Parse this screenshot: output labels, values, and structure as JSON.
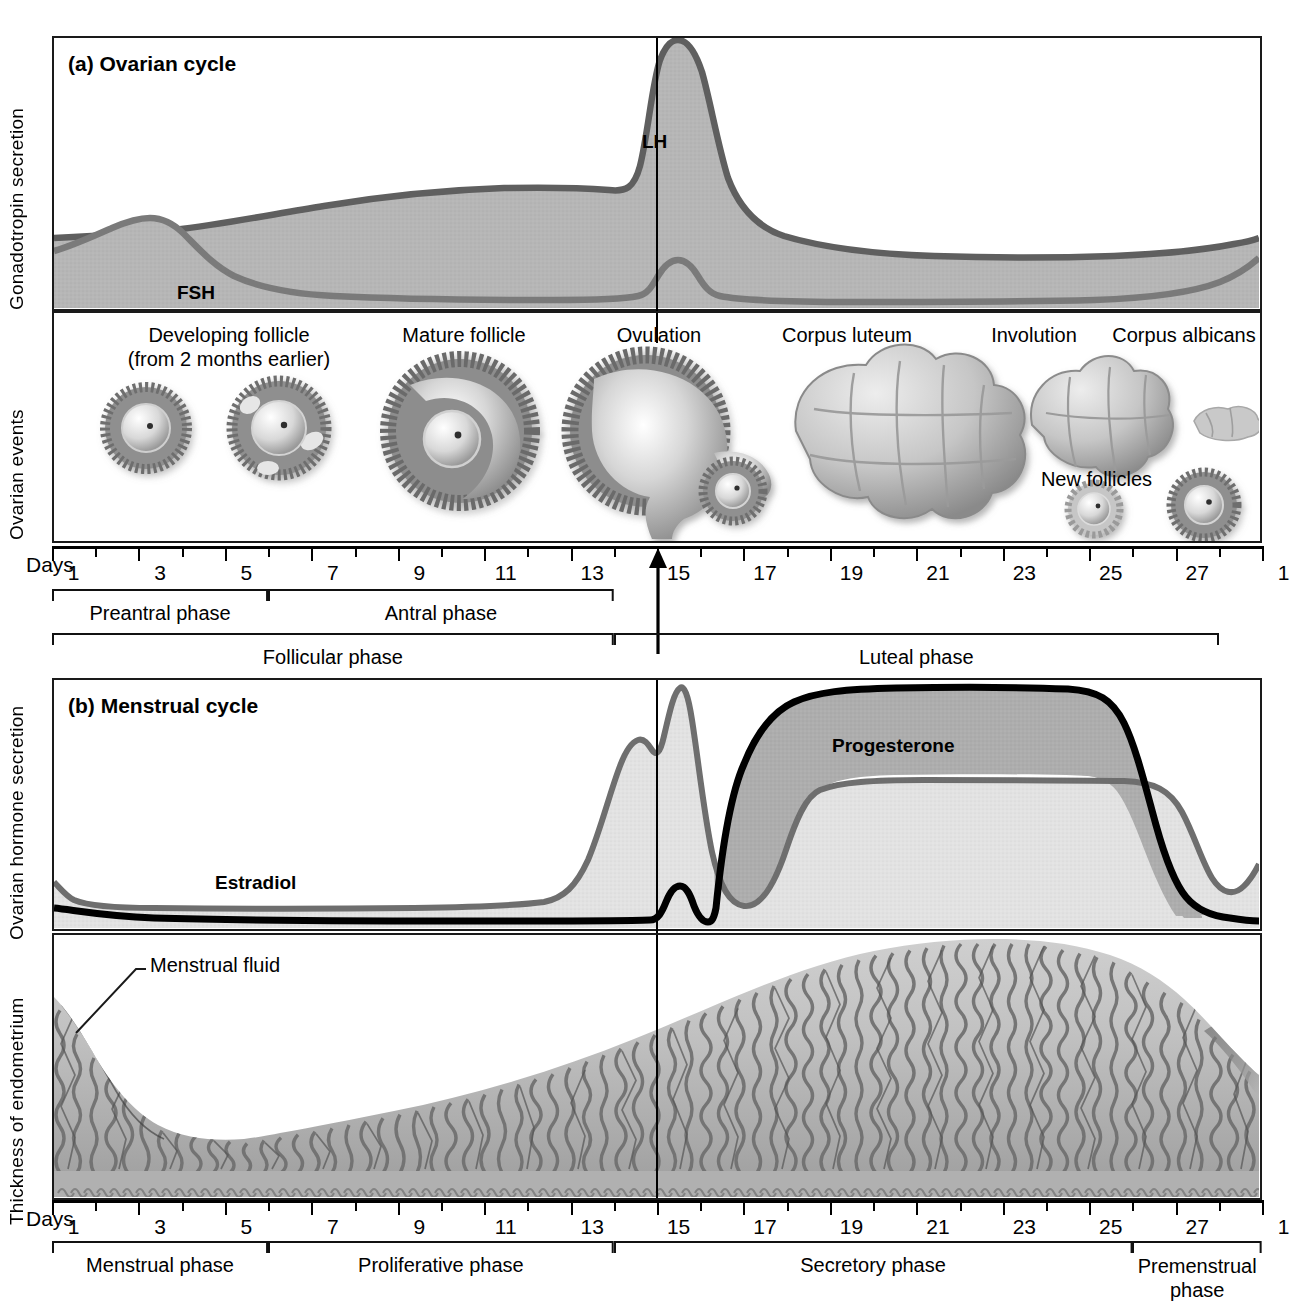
{
  "figure": {
    "panel_a": {
      "title": "(a) Ovarian cycle",
      "y_axis_top": "Gonadotropin secretion",
      "y_axis_bottom": "Ovarian events",
      "curve_labels": {
        "lh": "LH",
        "fsh": "FSH"
      },
      "event_labels": [
        "Developing follicle",
        "(from 2 months earlier)",
        "Mature follicle",
        "Ovulation",
        "Corpus luteum",
        "Involution",
        "Corpus albicans",
        "New follicles"
      ],
      "days_word": "Days",
      "day_ticks": [
        "1",
        "3",
        "5",
        "7",
        "9",
        "11",
        "13",
        "15",
        "17",
        "19",
        "21",
        "23",
        "25",
        "27",
        "1"
      ],
      "brackets": [
        {
          "label": "Preantral phase",
          "start_day": 1,
          "end_day": 6
        },
        {
          "label": "Antral phase",
          "start_day": 6,
          "end_day": 14
        },
        {
          "label": "Follicular phase",
          "start_day": 1,
          "end_day": 14
        },
        {
          "label": "Luteal phase",
          "start_day": 14,
          "end_day": 28
        }
      ]
    },
    "panel_b": {
      "title": "(b) Menstrual cycle",
      "y_axis_top": "Ovarian hormone secretion",
      "y_axis_bottom": "Thickness of endometrium",
      "curve_labels": {
        "estradiol": "Estradiol",
        "progesterone": "Progesterone"
      },
      "annotation": "Menstrual fluid",
      "days_word": "Days",
      "day_ticks": [
        "1",
        "3",
        "5",
        "7",
        "9",
        "11",
        "13",
        "15",
        "17",
        "19",
        "21",
        "23",
        "25",
        "27",
        "1"
      ],
      "brackets": [
        {
          "label": "Menstrual phase",
          "start_day": 1,
          "end_day": 6
        },
        {
          "label": "Proliferative phase",
          "start_day": 6,
          "end_day": 14
        },
        {
          "label": "Secretory phase",
          "start_day": 14,
          "end_day": 26
        },
        {
          "label": "Premenstrual phase",
          "start_day": 26,
          "end_day": 29
        }
      ]
    }
  },
  "colors": {
    "ink": "#1a1a1a",
    "curve_gray": "#6d6d6d",
    "fill_gray": "#b3b3b3",
    "fill_light": "#dcdcdc",
    "fill_mid": "#a8a8a8",
    "tissue": "#9c9c9c"
  },
  "chart_data": [
    {
      "type": "area",
      "title": "(a) Ovarian cycle",
      "xlabel": "Days",
      "ylabel": "Gonadotropin secretion",
      "x": [
        1,
        2,
        3,
        4,
        5,
        6,
        7,
        8,
        9,
        10,
        11,
        12,
        13,
        14,
        15,
        16,
        17,
        18,
        19,
        20,
        21,
        22,
        23,
        24,
        25,
        26,
        27,
        28
      ],
      "series": [
        {
          "name": "LH",
          "values": [
            28,
            30,
            30,
            30,
            31,
            34,
            38,
            42,
            45,
            46,
            46,
            44,
            62,
            100,
            58,
            40,
            32,
            28,
            26,
            25,
            24,
            24,
            24,
            24,
            26,
            30,
            36,
            44
          ]
        },
        {
          "name": "FSH",
          "values": [
            30,
            40,
            45,
            44,
            38,
            30,
            23,
            18,
            15,
            13,
            12,
            12,
            20,
            28,
            17,
            13,
            11,
            10,
            10,
            10,
            10,
            10,
            10,
            11,
            13,
            18,
            26,
            36
          ]
        }
      ],
      "grid": false,
      "legend": "inline annotations (LH, FSH)",
      "ylim": [
        0,
        100
      ]
    },
    {
      "type": "area",
      "title": "(b) Menstrual cycle",
      "xlabel": "Days",
      "ylabel": "Ovarian hormone secretion",
      "x": [
        1,
        2,
        3,
        4,
        5,
        6,
        7,
        8,
        9,
        10,
        11,
        12,
        13,
        14,
        15,
        16,
        17,
        18,
        19,
        20,
        21,
        22,
        23,
        24,
        25,
        26,
        27,
        28
      ],
      "series": [
        {
          "name": "Estradiol",
          "values": [
            16,
            10,
            9,
            9,
            9,
            9,
            9,
            10,
            12,
            18,
            30,
            55,
            70,
            100,
            40,
            55,
            62,
            64,
            65,
            65,
            65,
            65,
            65,
            65,
            64,
            50,
            24,
            16
          ]
        },
        {
          "name": "Progesterone",
          "values": [
            4,
            3,
            3,
            3,
            3,
            3,
            3,
            3,
            3,
            3,
            3,
            4,
            12,
            6,
            82,
            94,
            97,
            98,
            98,
            98,
            98,
            98,
            97,
            95,
            90,
            50,
            10,
            5
          ]
        }
      ],
      "grid": false,
      "legend": "inline annotations (Estradiol, Progesterone)",
      "ylim": [
        0,
        100
      ]
    },
    {
      "type": "area",
      "title": "Thickness of endometrium",
      "xlabel": "Days",
      "ylabel": "Thickness of endometrium",
      "x": [
        1,
        3,
        5,
        7,
        9,
        11,
        13,
        15,
        17,
        19,
        21,
        23,
        25,
        27,
        28
      ],
      "values": [
        92,
        60,
        22,
        26,
        34,
        44,
        55,
        66,
        80,
        92,
        100,
        100,
        96,
        86,
        92
      ],
      "grid": false,
      "ylim": [
        0,
        100
      ]
    }
  ]
}
